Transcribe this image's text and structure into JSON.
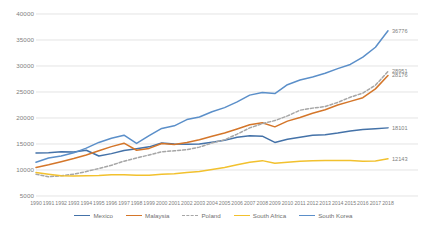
{
  "chart_data": {
    "type": "line",
    "title": "",
    "xlabel": "",
    "ylabel": "",
    "ylim": [
      5000,
      40000
    ],
    "ytick_values": [
      5000,
      10000,
      15000,
      20000,
      25000,
      30000,
      35000,
      40000
    ],
    "ytick_labels": [
      "5000",
      "10000",
      "15000",
      "20000",
      "25000",
      "30000",
      "35000",
      "40000"
    ],
    "grid": true,
    "legend_position": "bottom",
    "categories": [
      "1990",
      "1991",
      "1992",
      "1993",
      "1994",
      "1995",
      "1996",
      "1997",
      "1998",
      "1999",
      "2000",
      "2001",
      "2002",
      "2003",
      "2004",
      "2005",
      "2006",
      "2007",
      "2008",
      "2009",
      "2010",
      "2011",
      "2012",
      "2013",
      "2014",
      "2015",
      "2016",
      "2017",
      "2018"
    ],
    "series": [
      {
        "name": "Mexico",
        "color": "#4472a8",
        "style": "solid",
        "end_label": "18101",
        "values": [
          13250,
          13300,
          13500,
          13450,
          13800,
          12700,
          13150,
          13750,
          14100,
          14450,
          15200,
          15000,
          14950,
          15000,
          15350,
          15700,
          16300,
          16600,
          16500,
          15300,
          15900,
          16300,
          16700,
          16800,
          17100,
          17500,
          17800,
          17950,
          18101
        ]
      },
      {
        "name": "Malaysia",
        "color": "#d4762a",
        "style": "solid",
        "end_label": "28176",
        "values": [
          10500,
          11000,
          11600,
          12200,
          12900,
          13700,
          14500,
          15150,
          13800,
          14150,
          15100,
          14900,
          15300,
          15800,
          16500,
          17100,
          17900,
          18700,
          19100,
          18300,
          19400,
          20100,
          20900,
          21600,
          22500,
          23200,
          23900,
          25600,
          28176
        ]
      },
      {
        "name": "Poland",
        "color": "#a6a6a6",
        "style": "dashed",
        "end_label": "28951",
        "values": [
          9200,
          8700,
          8900,
          9200,
          9700,
          10300,
          10900,
          11700,
          12300,
          12900,
          13500,
          13700,
          13900,
          14400,
          15200,
          15800,
          16900,
          18100,
          18900,
          19500,
          20400,
          21500,
          21900,
          22200,
          23000,
          24000,
          24800,
          26300,
          28951
        ]
      },
      {
        "name": "South Africa",
        "color": "#f2c12e",
        "style": "solid",
        "end_label": "12143",
        "values": [
          9500,
          9200,
          8900,
          8850,
          8900,
          8950,
          9100,
          9100,
          9000,
          9000,
          9200,
          9300,
          9500,
          9700,
          10100,
          10500,
          11000,
          11500,
          11800,
          11300,
          11500,
          11700,
          11800,
          11850,
          11850,
          11850,
          11700,
          11750,
          12143
        ]
      },
      {
        "name": "South Korea",
        "color": "#5b8fc9",
        "style": "solid",
        "end_label": "36776",
        "values": [
          11500,
          12300,
          12700,
          13300,
          14200,
          15300,
          16100,
          16700,
          15100,
          16600,
          18000,
          18500,
          19700,
          20200,
          21200,
          22000,
          23100,
          24400,
          24900,
          24700,
          26400,
          27300,
          27900,
          28600,
          29500,
          30300,
          31700,
          33600,
          36776
        ]
      }
    ],
    "end_labels": [
      {
        "series": "South Korea",
        "text": "36776"
      },
      {
        "series": "Poland",
        "text": "28951"
      },
      {
        "series": "Malaysia",
        "text": "28176"
      },
      {
        "series": "Mexico",
        "text": "18101"
      },
      {
        "series": "South Africa",
        "text": "12143"
      }
    ],
    "legend": [
      {
        "label": "Mexico",
        "color": "#4472a8",
        "style": "solid"
      },
      {
        "label": "Malaysia",
        "color": "#d4762a",
        "style": "solid"
      },
      {
        "label": "Poland",
        "color": "#a6a6a6",
        "style": "dashed"
      },
      {
        "label": "South Africa",
        "color": "#f2c12e",
        "style": "solid"
      },
      {
        "label": "South Korea",
        "color": "#5b8fc9",
        "style": "solid"
      }
    ]
  },
  "axis_color": "#d9d9d9",
  "tick_text_color": "#808080"
}
